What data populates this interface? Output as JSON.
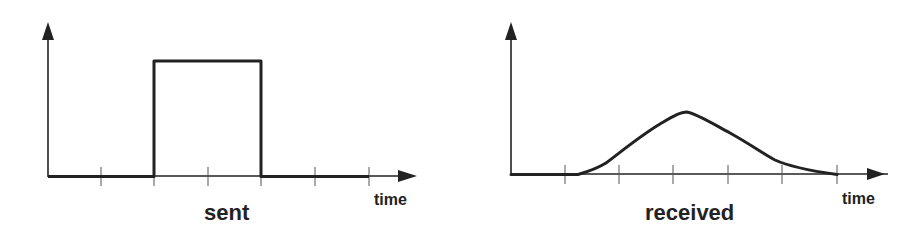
{
  "diagrams": [
    {
      "id": "sent",
      "caption": "sent",
      "x_axis_label": "time",
      "signal_shape": "rectangular-pulse",
      "tick_count": 6
    },
    {
      "id": "received",
      "caption": "received",
      "x_axis_label": "time",
      "signal_shape": "smoothed-bell-pulse",
      "tick_count": 6
    }
  ],
  "colors": {
    "stroke": "#222222",
    "background": "#ffffff"
  }
}
